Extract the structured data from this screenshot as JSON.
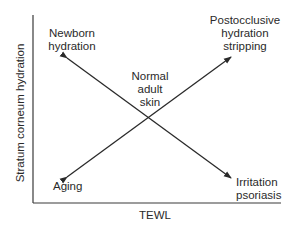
{
  "diagram": {
    "axes": {
      "x_label": "TEWL",
      "y_label": "Stratum corneum hydration"
    },
    "center_label": "Normal\nadult\nskin",
    "corners": {
      "top_left": "Newborn\nhydration",
      "top_right": "Postocclusive\nhydration\nstripping",
      "bottom_left": "Aging",
      "bottom_right": "Irritation\npsoriasis"
    },
    "arrows": [
      {
        "from": "center",
        "to": "top_left"
      },
      {
        "from": "center",
        "to": "top_right"
      },
      {
        "from": "center",
        "to": "bottom_left"
      },
      {
        "from": "center",
        "to": "bottom_right"
      }
    ],
    "colors": {
      "line": "#2a2a2a",
      "text": "#2a2a2a",
      "background": "#ffffff"
    }
  }
}
